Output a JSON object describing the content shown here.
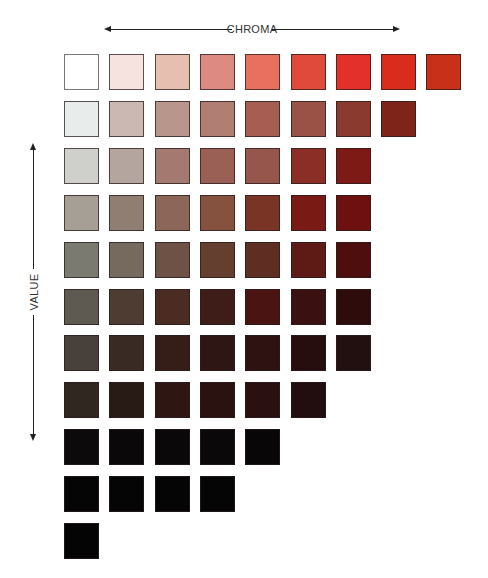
{
  "chart_data": {
    "type": "heatmap",
    "title": "",
    "xlabel": "CHROMA",
    "ylabel": "VALUE",
    "x_direction": "bidirectional arrow (chroma increases left to right)",
    "y_direction": "bidirectional arrow (value increases upward)",
    "grid": false,
    "legend": "none",
    "rows": [
      {
        "row": 1,
        "count": 9,
        "colors": [
          "#ffffff",
          "#f6e2df",
          "#e6bfb1",
          "#dc8a82",
          "#e8705e",
          "#e04a3a",
          "#e3302a",
          "#d92c1a",
          "#c9301a"
        ]
      },
      {
        "row": 2,
        "count": 8,
        "colors": [
          "#e8eceb",
          "#cbb8b2",
          "#b8968c",
          "#b07e72",
          "#a65d52",
          "#9a5246",
          "#8a3a2e",
          "#7e2418"
        ]
      },
      {
        "row": 3,
        "count": 7,
        "colors": [
          "#cfd0cb",
          "#b4a59e",
          "#a47a70",
          "#9a5f55",
          "#97564c",
          "#8a2e26",
          "#7e1a16"
        ]
      },
      {
        "row": 4,
        "count": 7,
        "colors": [
          "#a59f96",
          "#917e72",
          "#8c6658",
          "#84523f",
          "#7a3426",
          "#7a1a14",
          "#6c1010"
        ]
      },
      {
        "row": 5,
        "count": 7,
        "colors": [
          "#7b7a70",
          "#766a5e",
          "#6e5246",
          "#643e2e",
          "#5e2e22",
          "#5e1a14",
          "#4e0e0e"
        ]
      },
      {
        "row": 6,
        "count": 7,
        "colors": [
          "#5e5a52",
          "#4e3c32",
          "#4a2c22",
          "#3e1c18",
          "#4a1412",
          "#3a1010",
          "#2e0c0c"
        ]
      },
      {
        "row": 7,
        "count": 7,
        "colors": [
          "#48403a",
          "#3a2a24",
          "#361e18",
          "#2e1614",
          "#2e1212",
          "#260e0e",
          "#221010"
        ]
      },
      {
        "row": 8,
        "count": 6,
        "colors": [
          "#302820",
          "#281a14",
          "#2e1612",
          "#2a1210",
          "#2a1010",
          "#220e0e"
        ]
      },
      {
        "row": 9,
        "count": 5,
        "colors": [
          "#0c0a0a",
          "#0a0808",
          "#0a0808",
          "#0a0808",
          "#080606"
        ]
      },
      {
        "row": 10,
        "count": 4,
        "colors": [
          "#060505",
          "#060505",
          "#060505",
          "#060505"
        ]
      },
      {
        "row": 11,
        "count": 1,
        "colors": [
          "#040404"
        ]
      }
    ]
  },
  "labels": {
    "chroma": "CHROMA",
    "value": "VALUE"
  }
}
